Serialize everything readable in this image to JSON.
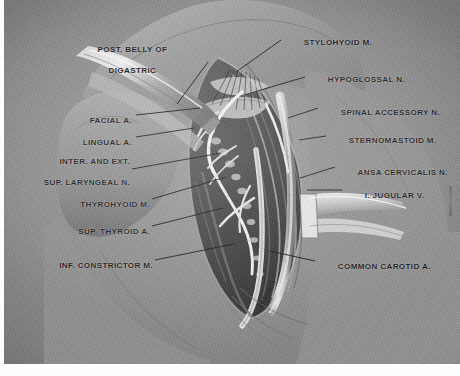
{
  "plate": {
    "domain": "anatomical-illustration",
    "subject": "Carotid triangle neck dissection",
    "medium": "halftone grayscale plate",
    "background_color": "#8c8c8c",
    "ink_color": "#131313",
    "paper_color": "#fefefe"
  },
  "signature": {
    "text": "P. Lynch",
    "rotation_deg": -62
  },
  "labels": [
    {
      "id": "post-belly-of-digastric",
      "lines": [
        "POST. BELLY OF",
        "DIGASTRIC"
      ],
      "align": "center",
      "x": 118,
      "y": 40,
      "leader": {
        "x1": 204,
        "y1": 62,
        "x2": 173,
        "y2": 104
      }
    },
    {
      "id": "stylohyoid-m",
      "lines": [
        "STYLOHYOID M."
      ],
      "align": "left",
      "x": 279,
      "y": 33,
      "leader": {
        "x1": 277,
        "y1": 40,
        "x2": 232,
        "y2": 72
      }
    },
    {
      "id": "hypoglossal-n",
      "lines": [
        "HYPOGLOSSAL N."
      ],
      "align": "left",
      "x": 303,
      "y": 70,
      "leader": {
        "x1": 301,
        "y1": 77,
        "x2": 240,
        "y2": 95
      }
    },
    {
      "id": "spinal-accessory-n",
      "lines": [
        "SPINAL ACCESSORY N."
      ],
      "align": "left",
      "x": 316,
      "y": 103,
      "leader": {
        "x1": 314,
        "y1": 108,
        "x2": 284,
        "y2": 118
      }
    },
    {
      "id": "sternomastoid-m",
      "lines": [
        "STERNOMASTOID M."
      ],
      "align": "left",
      "x": 324,
      "y": 131,
      "leader": {
        "x1": 322,
        "y1": 136,
        "x2": 295,
        "y2": 140
      }
    },
    {
      "id": "ansa-cervicalis-n",
      "lines": [
        "ANSA CERVICALIS N."
      ],
      "align": "left",
      "x": 333,
      "y": 163,
      "leader": {
        "x1": 331,
        "y1": 167,
        "x2": 296,
        "y2": 178
      }
    },
    {
      "id": "internal-jugular-v",
      "lines": [
        "I. JUGULAR V."
      ],
      "align": "left",
      "x": 340,
      "y": 186,
      "leader": {
        "x1": 338,
        "y1": 190,
        "x2": 303,
        "y2": 190
      }
    },
    {
      "id": "common-carotid-a",
      "lines": [
        "COMMON CAROTID A."
      ],
      "align": "left",
      "x": 313,
      "y": 257,
      "leader": {
        "x1": 311,
        "y1": 261,
        "x2": 266,
        "y2": 251
      }
    },
    {
      "id": "facial-a",
      "lines": [
        "FACIAL A."
      ],
      "align": "right",
      "x": 74,
      "y": 111,
      "leader": {
        "x1": 132,
        "y1": 115,
        "x2": 196,
        "y2": 108
      }
    },
    {
      "id": "lingual-a",
      "lines": [
        "LINGUAL A."
      ],
      "align": "right",
      "x": 74,
      "y": 133,
      "leader": {
        "x1": 132,
        "y1": 137,
        "x2": 190,
        "y2": 128
      }
    },
    {
      "id": "internal-and-external-superior-laryngeal-n",
      "lines": [
        "INTER. AND EXT.",
        "SUP. LARYNGEAL N."
      ],
      "align": "right",
      "x": 14,
      "y": 152,
      "leader": {
        "x1": 128,
        "y1": 169,
        "x2": 217,
        "y2": 153
      }
    },
    {
      "id": "thyrohyoid-m",
      "lines": [
        "THYROHYOID M."
      ],
      "align": "right",
      "x": 61,
      "y": 195,
      "leader": {
        "x1": 148,
        "y1": 199,
        "x2": 222,
        "y2": 177
      }
    },
    {
      "id": "sup-thyroid-a",
      "lines": [
        "SUP. THYROID A."
      ],
      "align": "right",
      "x": 58,
      "y": 222,
      "leader": {
        "x1": 148,
        "y1": 226,
        "x2": 219,
        "y2": 208
      }
    },
    {
      "id": "inf-constrictor-m",
      "lines": [
        "INF. CONSTRICTOR M."
      ],
      "align": "right",
      "x": 31,
      "y": 256,
      "leader": {
        "x1": 151,
        "y1": 260,
        "x2": 230,
        "y2": 244
      }
    }
  ]
}
